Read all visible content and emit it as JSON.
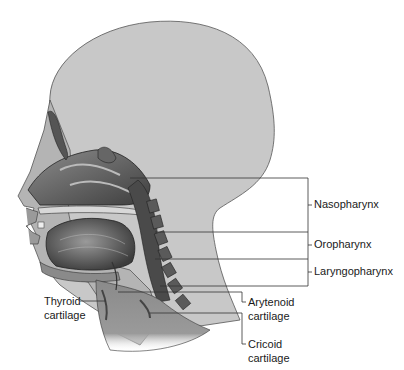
{
  "figure": {
    "colors": {
      "head_fill": "#c8c8c8",
      "head_outline": "#555555",
      "tissue_dark": "#3a3a3a",
      "tissue_mid": "#7a7a7a",
      "tissue_light": "#a8a8a8",
      "leader_line": "#333333",
      "label_text": "#1a1a1a"
    }
  },
  "labels": {
    "nasopharynx": "Nasopharynx",
    "oropharynx": "Oropharynx",
    "laryngopharynx": "Laryngopharynx",
    "thyroid_l1": "Thyroid",
    "thyroid_l2": "cartilage",
    "arytenoid_l1": "Arytenoid",
    "arytenoid_l2": "cartilage",
    "cricoid_l1": "Cricoid",
    "cricoid_l2": "cartilage"
  }
}
